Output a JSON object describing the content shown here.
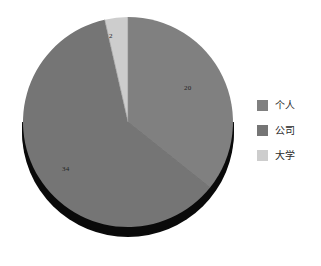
{
  "chart_data": {
    "type": "pie",
    "title": "",
    "subtitle": "",
    "xlabel": "",
    "ylabel": "",
    "grid": false,
    "legend_position": "right",
    "total": 56,
    "start_angle_deg": 0,
    "direction": "clockwise",
    "three_d": true,
    "categories": [
      "个人",
      "公司",
      "大学"
    ],
    "values": [
      20,
      34,
      2
    ],
    "data_labels": [
      "20",
      "34",
      "2"
    ],
    "colors": [
      "#808080",
      "#757575",
      "#cdcdcd"
    ],
    "side_wall_color": "#0a0a0a",
    "slices": [
      {
        "label": "个人",
        "value": 20,
        "data_label": "20",
        "color": "#808080",
        "start_angle_deg": 0,
        "end_angle_deg": 128.571,
        "percent": "35.7%"
      },
      {
        "label": "公司",
        "value": 34,
        "data_label": "34",
        "color": "#757575",
        "start_angle_deg": 128.571,
        "end_angle_deg": 347.143,
        "percent": "60.7%"
      },
      {
        "label": "大学",
        "value": 2,
        "data_label": "2",
        "color": "#cdcdcd",
        "start_angle_deg": 347.143,
        "end_angle_deg": 360,
        "percent": "3.6%"
      }
    ]
  },
  "legend": {
    "items": [
      {
        "label": "个人",
        "color": "#808080",
        "swatch_name": "legend-swatch-individual"
      },
      {
        "label": "公司",
        "color": "#757575",
        "swatch_name": "legend-swatch-company"
      },
      {
        "label": "大学",
        "color": "#cdcdcd",
        "swatch_name": "legend-swatch-university"
      }
    ]
  },
  "labels": {
    "individual": "20",
    "company": "34",
    "university": "2"
  }
}
